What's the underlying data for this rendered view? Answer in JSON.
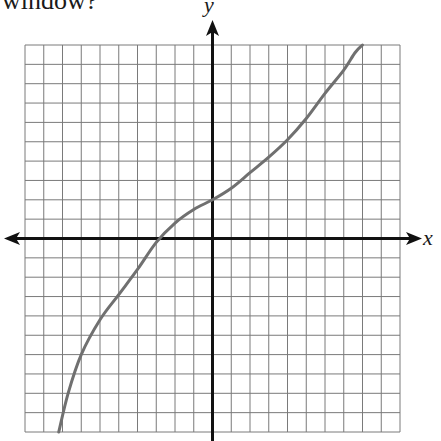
{
  "question": {
    "caption_fragment": "window?"
  },
  "graph": {
    "x_axis_label": "x",
    "y_axis_label": "y",
    "grid": {
      "columns": 20,
      "rows": 20,
      "x_range": [
        -10,
        10
      ],
      "y_range": [
        -10,
        10
      ],
      "left_px": 25,
      "top_px": 45,
      "right_px": 400,
      "bottom_px": 432,
      "line_color": "#7a7a7a",
      "axis_color": "#111111"
    },
    "curve": {
      "color": "#707070",
      "description": "increasing S-shaped curve, y-intercept 2, x-intercept -3",
      "points": [
        [
          -8.2,
          -10
        ],
        [
          -7.7,
          -8
        ],
        [
          -7,
          -6
        ],
        [
          -6,
          -4.2
        ],
        [
          -5,
          -2.9
        ],
        [
          -4,
          -1.6
        ],
        [
          -3,
          -0.2
        ],
        [
          -2,
          0.8
        ],
        [
          -1,
          1.5
        ],
        [
          0,
          2
        ],
        [
          1,
          2.6
        ],
        [
          2,
          3.4
        ],
        [
          3,
          4.2
        ],
        [
          4,
          5.1
        ],
        [
          5,
          6.2
        ],
        [
          6,
          7.5
        ],
        [
          7,
          8.7
        ],
        [
          7.6,
          9.6
        ],
        [
          8,
          10
        ]
      ]
    }
  }
}
